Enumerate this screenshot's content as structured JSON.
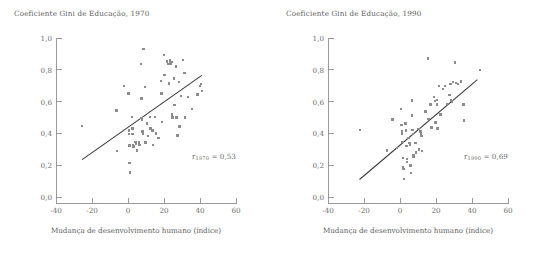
{
  "figure": {
    "panel_count": 2,
    "marker_color": "#8c8c8c",
    "line_color": "#3a3a3a",
    "axis_color": "#9a9a9a",
    "text_color": "#6c6c6c"
  },
  "panels": [
    {
      "key": "p1970",
      "title": "Coeficiente Gini de Educação, 1970",
      "xlabel": "Mudança de desenvolvimento humano (índice)",
      "annotation": {
        "symbol": "r",
        "subscript": "1970",
        "equals": "=",
        "value": "0,53"
      }
    },
    {
      "key": "p1990",
      "title": "Coeficiente Gini de Educação, 1990",
      "xlabel": "Mudança de desenvolvimento humano (índice)",
      "annotation": {
        "symbol": "r",
        "subscript": "1990",
        "equals": "=",
        "value": "0,69"
      }
    }
  ],
  "axes": {
    "x": {
      "min": -40,
      "max": 60,
      "ticks": [
        -40,
        -20,
        0,
        20,
        40,
        60
      ],
      "tick_labels": [
        "-40",
        "-20",
        "0",
        "20",
        "40",
        "60"
      ]
    },
    "y": {
      "min": 0.0,
      "max": 1.0,
      "ticks": [
        0.0,
        0.2,
        0.4,
        0.6,
        0.8,
        1.0
      ],
      "tick_labels": [
        "0,0",
        "0,2",
        "0,4",
        "0,6",
        "0,8",
        "1,0"
      ]
    }
  },
  "chart_data": [
    {
      "type": "scatter",
      "title": "Coeficiente Gini de Educação, 1970",
      "xlabel": "Mudança de desenvolvimento humano (índice)",
      "ylabel": "Coeficiente Gini de Educação, 1970",
      "xlim": [
        -40,
        60
      ],
      "ylim": [
        0.0,
        1.0
      ],
      "grid": false,
      "legend": "none",
      "annotation": "r 1970 = 0,53",
      "correlation": 0.53,
      "trendline": {
        "x": [
          -25.5,
          41.0
        ],
        "y": [
          0.235,
          0.765
        ]
      },
      "points": [
        [
          -25.5,
          0.447
        ],
        [
          -6.5,
          0.543
        ],
        [
          -6.2,
          0.288
        ],
        [
          -2.2,
          0.697
        ],
        [
          0.2,
          0.652
        ],
        [
          0.4,
          0.418
        ],
        [
          0.6,
          0.397
        ],
        [
          0.8,
          0.325
        ],
        [
          0.9,
          0.212
        ],
        [
          1.0,
          0.155
        ],
        [
          2.2,
          0.502
        ],
        [
          2.4,
          0.432
        ],
        [
          2.6,
          0.397
        ],
        [
          2.8,
          0.327
        ],
        [
          3.0,
          0.318
        ],
        [
          4.2,
          0.345
        ],
        [
          4.6,
          0.332
        ],
        [
          5.0,
          0.293
        ],
        [
          6.0,
          0.342
        ],
        [
          6.4,
          0.327
        ],
        [
          7.2,
          0.838
        ],
        [
          7.4,
          0.62
        ],
        [
          7.6,
          0.497
        ],
        [
          7.8,
          0.487
        ],
        [
          8.0,
          0.412
        ],
        [
          8.2,
          0.398
        ],
        [
          8.6,
          0.932
        ],
        [
          9.4,
          0.692
        ],
        [
          9.8,
          0.343
        ],
        [
          10.6,
          0.462
        ],
        [
          11.0,
          0.385
        ],
        [
          12.2,
          0.502
        ],
        [
          12.6,
          0.432
        ],
        [
          13.6,
          0.418
        ],
        [
          14.0,
          0.327
        ],
        [
          15.0,
          0.503
        ],
        [
          15.4,
          0.4
        ],
        [
          17.0,
          0.372
        ],
        [
          18.2,
          0.73
        ],
        [
          18.6,
          0.652
        ],
        [
          19.0,
          0.47
        ],
        [
          20.0,
          0.893
        ],
        [
          20.2,
          0.768
        ],
        [
          21.6,
          0.852
        ],
        [
          22.4,
          0.838
        ],
        [
          22.8,
          0.715
        ],
        [
          23.4,
          0.862
        ],
        [
          23.6,
          0.845
        ],
        [
          23.8,
          0.84
        ],
        [
          24.2,
          0.848
        ],
        [
          24.4,
          0.52
        ],
        [
          24.8,
          0.5
        ],
        [
          25.6,
          0.745
        ],
        [
          25.8,
          0.58
        ],
        [
          26.6,
          0.82
        ],
        [
          27.0,
          0.5
        ],
        [
          27.4,
          0.387
        ],
        [
          28.2,
          0.722
        ],
        [
          28.6,
          0.443
        ],
        [
          29.4,
          0.635
        ],
        [
          30.6,
          0.86
        ],
        [
          31.4,
          0.78
        ],
        [
          31.8,
          0.5
        ],
        [
          33.4,
          0.63
        ],
        [
          35.6,
          0.552
        ],
        [
          38.6,
          0.645
        ],
        [
          40.0,
          0.7
        ],
        [
          40.6,
          0.712
        ],
        [
          41.2,
          0.665
        ]
      ]
    },
    {
      "type": "scatter",
      "title": "Coeficiente Gini de Educação, 1990",
      "xlabel": "Mudança de desenvolvimento humano (índice)",
      "ylabel": "Coeficiente Gini de Educação, 1990",
      "xlim": [
        -40,
        60
      ],
      "ylim": [
        0.0,
        1.0
      ],
      "grid": false,
      "legend": "none",
      "annotation": "r 1990 = 0,69",
      "correlation": 0.69,
      "trendline": {
        "x": [
          -22.5,
          43.0
        ],
        "y": [
          0.11,
          0.738
        ]
      },
      "points": [
        [
          -22.2,
          0.42
        ],
        [
          -7.2,
          0.292
        ],
        [
          -4.2,
          0.487
        ],
        [
          -1.8,
          0.308
        ],
        [
          0.4,
          0.553
        ],
        [
          0.8,
          0.452
        ],
        [
          1.0,
          0.412
        ],
        [
          1.2,
          0.395
        ],
        [
          1.4,
          0.347
        ],
        [
          1.6,
          0.245
        ],
        [
          1.8,
          0.185
        ],
        [
          2.0,
          0.178
        ],
        [
          2.2,
          0.112
        ],
        [
          3.0,
          0.463
        ],
        [
          3.2,
          0.418
        ],
        [
          3.6,
          0.322
        ],
        [
          3.8,
          0.238
        ],
        [
          4.0,
          0.222
        ],
        [
          4.8,
          0.37
        ],
        [
          5.2,
          0.338
        ],
        [
          5.6,
          0.327
        ],
        [
          5.8,
          0.197
        ],
        [
          6.0,
          0.15
        ],
        [
          6.6,
          0.607
        ],
        [
          6.8,
          0.512
        ],
        [
          7.0,
          0.42
        ],
        [
          7.2,
          0.398
        ],
        [
          7.4,
          0.262
        ],
        [
          7.6,
          0.252
        ],
        [
          8.6,
          0.34
        ],
        [
          9.0,
          0.28
        ],
        [
          10.2,
          0.428
        ],
        [
          10.6,
          0.3
        ],
        [
          11.4,
          0.412
        ],
        [
          11.8,
          0.398
        ],
        [
          12.0,
          0.382
        ],
        [
          12.2,
          0.288
        ],
        [
          14.2,
          0.537
        ],
        [
          15.4,
          0.872
        ],
        [
          15.8,
          0.492
        ],
        [
          17.0,
          0.582
        ],
        [
          17.4,
          0.438
        ],
        [
          19.0,
          0.628
        ],
        [
          19.4,
          0.602
        ],
        [
          19.8,
          0.468
        ],
        [
          20.4,
          0.612
        ],
        [
          20.6,
          0.583
        ],
        [
          20.8,
          0.43
        ],
        [
          21.8,
          0.697
        ],
        [
          22.4,
          0.52
        ],
        [
          24.0,
          0.68
        ],
        [
          25.0,
          0.698
        ],
        [
          26.2,
          0.586
        ],
        [
          27.4,
          0.643
        ],
        [
          28.0,
          0.712
        ],
        [
          28.4,
          0.607
        ],
        [
          28.8,
          0.6
        ],
        [
          29.6,
          0.722
        ],
        [
          30.6,
          0.845
        ],
        [
          31.0,
          0.718
        ],
        [
          32.2,
          0.712
        ],
        [
          33.8,
          0.727
        ],
        [
          35.2,
          0.582
        ],
        [
          35.6,
          0.48
        ],
        [
          44.4,
          0.8
        ]
      ]
    }
  ]
}
